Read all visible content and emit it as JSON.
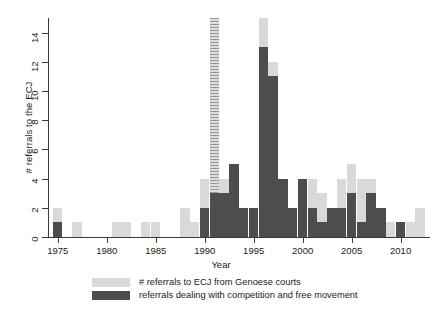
{
  "chart_data": {
    "type": "bar",
    "title": "",
    "xlabel": "Year",
    "ylabel": "# referrals to the ECJ",
    "xlim": [
      1974,
      2013
    ],
    "ylim": [
      0,
      15
    ],
    "ytick_labels": [
      "0",
      "2",
      "4",
      "6",
      "8",
      "10",
      "12",
      "14"
    ],
    "ytick_values": [
      0,
      2,
      4,
      6,
      8,
      10,
      12,
      14
    ],
    "xtick_labels": [
      "1975",
      "1980",
      "1985",
      "1990",
      "1995",
      "2000",
      "2005",
      "2010"
    ],
    "xtick_values": [
      1975,
      1980,
      1985,
      1990,
      1995,
      2000,
      2005,
      2010
    ],
    "grid": false,
    "legend_position": "below",
    "colors": {
      "light": "#d9d9d9",
      "dark": "#4d4d4d",
      "axis": "#3a3a3a",
      "background": "#ffffff"
    },
    "note": "1991 total bar is truncated at top of axis and drawn hatched",
    "categories": [
      1975,
      1976,
      1977,
      1978,
      1979,
      1980,
      1981,
      1982,
      1983,
      1984,
      1985,
      1986,
      1987,
      1988,
      1989,
      1990,
      1991,
      1992,
      1993,
      1994,
      1995,
      1996,
      1997,
      1998,
      1999,
      2000,
      2001,
      2002,
      2003,
      2004,
      2005,
      2006,
      2007,
      2008,
      2009,
      2010,
      2011,
      2012
    ],
    "series": [
      {
        "name": "# referrals to ECJ from Genoese courts",
        "key": "total",
        "color": "#d9d9d9",
        "values": [
          2,
          0,
          1,
          0,
          0,
          0,
          1,
          1,
          0,
          1,
          1,
          0,
          0,
          2,
          1,
          4,
          15,
          4,
          5,
          2,
          2,
          15,
          12,
          4,
          2,
          4,
          4,
          3,
          2,
          4,
          5,
          4,
          4,
          0,
          1,
          0,
          1,
          2
        ]
      },
      {
        "name": "referrals dealing with competition and free movement",
        "key": "competition",
        "color": "#4d4d4d",
        "values": [
          1,
          0,
          0,
          0,
          0,
          0,
          0,
          0,
          0,
          0,
          0,
          0,
          0,
          0,
          0,
          2,
          3,
          3,
          5,
          2,
          2,
          13,
          11,
          4,
          2,
          4,
          2,
          1,
          2,
          2,
          3,
          1,
          3,
          2,
          0,
          1,
          0,
          0
        ]
      }
    ],
    "truncated_bars": [
      1991
    ]
  },
  "axes": {
    "y_title": "# referrals to the ECJ",
    "x_title": "Year"
  },
  "legend": {
    "entries": [
      {
        "swatch": "light",
        "label": "# referrals to ECJ from Genoese courts"
      },
      {
        "swatch": "dark",
        "label": "referrals dealing with competition and free movement"
      }
    ]
  }
}
